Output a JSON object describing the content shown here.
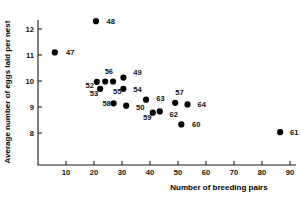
{
  "chart_data": {
    "type": "scatter",
    "title": "",
    "xlabel": "Number of breeding pairs",
    "ylabel": "Average number of eggs laid per nest",
    "xlim": [
      0,
      93
    ],
    "ylim": [
      7.4,
      12.7
    ],
    "xticks": [
      10,
      20,
      30,
      40,
      50,
      60,
      70,
      80,
      90
    ],
    "yticks": [
      8,
      9,
      10,
      11,
      12
    ],
    "grid": false,
    "legend": null,
    "points": [
      {
        "label": "47",
        "x": 6.0,
        "y": 11.1,
        "lx": 10.0,
        "ly": 11.1
      },
      {
        "label": "48",
        "x": 20.7,
        "y": 12.3,
        "lx": 24.5,
        "ly": 12.3
      },
      {
        "label": "49",
        "x": 30.5,
        "y": 10.13,
        "lx": 34.0,
        "ly": 10.33
      },
      {
        "label": "50",
        "x": 31.5,
        "y": 9.05,
        "lx": 35.0,
        "ly": 9.0
      },
      {
        "label": "52",
        "x": 21.0,
        "y": 9.97,
        "lx": 17.0,
        "ly": 9.83
      },
      {
        "label": "53",
        "x": 22.2,
        "y": 9.7,
        "lx": 18.5,
        "ly": 9.53
      },
      {
        "label": "54",
        "x": 30.5,
        "y": 9.7,
        "lx": 34.0,
        "ly": 9.7
      },
      {
        "label": "55",
        "x": 26.8,
        "y": 9.98,
        "lx": 26.8,
        "ly": 9.62
      },
      {
        "label": "56",
        "x": 24.0,
        "y": 9.98,
        "lx": 23.8,
        "ly": 10.38
      },
      {
        "label": "57",
        "x": 49.0,
        "y": 9.16,
        "lx": 49.0,
        "ly": 9.56
      },
      {
        "label": "58",
        "x": 27.0,
        "y": 9.14,
        "lx": 23.0,
        "ly": 9.14
      },
      {
        "label": "59",
        "x": 41.0,
        "y": 8.78,
        "lx": 37.5,
        "ly": 8.62
      },
      {
        "label": "60",
        "x": 51.2,
        "y": 8.33,
        "lx": 55.0,
        "ly": 8.33
      },
      {
        "label": "61",
        "x": 86.5,
        "y": 8.03,
        "lx": 90.0,
        "ly": 8.03
      },
      {
        "label": "62",
        "x": 43.5,
        "y": 8.83,
        "lx": 47.0,
        "ly": 8.73
      },
      {
        "label": "63",
        "x": 38.6,
        "y": 9.28,
        "lx": 42.2,
        "ly": 9.32
      },
      {
        "label": "64",
        "x": 53.4,
        "y": 9.1,
        "lx": 57.0,
        "ly": 9.1
      }
    ]
  }
}
